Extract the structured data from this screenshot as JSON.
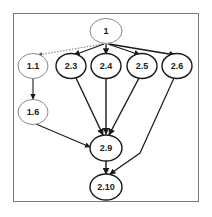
{
  "diagram": {
    "type": "directed-graph",
    "nodes": [
      {
        "id": "1",
        "label": "1",
        "cx": 106,
        "cy": 31,
        "style": "dashed"
      },
      {
        "id": "1.1",
        "label": "1.1",
        "cx": 33,
        "cy": 66,
        "style": "dashed"
      },
      {
        "id": "2.3",
        "label": "2.3",
        "cx": 71,
        "cy": 66,
        "style": "solid"
      },
      {
        "id": "2.4",
        "label": "2.4",
        "cx": 106,
        "cy": 66,
        "style": "solid"
      },
      {
        "id": "2.5",
        "label": "2.5",
        "cx": 142,
        "cy": 66,
        "style": "solid"
      },
      {
        "id": "2.6",
        "label": "2.6",
        "cx": 177,
        "cy": 66,
        "style": "solid"
      },
      {
        "id": "1.6",
        "label": "1.6",
        "cx": 33,
        "cy": 112,
        "style": "dashed"
      },
      {
        "id": "2.9",
        "label": "2.9",
        "cx": 106,
        "cy": 148,
        "style": "solid"
      },
      {
        "id": "2.10",
        "label": "2.10",
        "cx": 106,
        "cy": 187,
        "style": "solid"
      }
    ],
    "edges": [
      {
        "from": "1",
        "to": "1.1",
        "style": "dotted"
      },
      {
        "from": "1",
        "to": "2.3",
        "style": "solid"
      },
      {
        "from": "1",
        "to": "2.4",
        "style": "solid"
      },
      {
        "from": "1",
        "to": "2.5",
        "style": "solid"
      },
      {
        "from": "1",
        "to": "2.6",
        "style": "solid"
      },
      {
        "from": "1.1",
        "to": "1.6",
        "style": "solid"
      },
      {
        "from": "1.6",
        "to": "2.9",
        "style": "solid"
      },
      {
        "from": "2.3",
        "to": "2.9",
        "style": "solid"
      },
      {
        "from": "2.4",
        "to": "2.9",
        "style": "solid"
      },
      {
        "from": "2.5",
        "to": "2.9",
        "style": "solid"
      },
      {
        "from": "2.9",
        "to": "2.10",
        "style": "solid"
      },
      {
        "from": "2.6",
        "to": "2.10",
        "style": "solid"
      }
    ]
  },
  "labels": {
    "n1": "1",
    "n1_1": "1.1",
    "n2_3": "2.3",
    "n2_4": "2.4",
    "n2_5": "2.5",
    "n2_6": "2.6",
    "n1_6": "1.6",
    "n2_9": "2.9",
    "n2_10": "2.10"
  },
  "colors": {
    "solid_stroke": "#1a1a1a",
    "dashed_stroke": "#8a8a8a",
    "frame": "#7a7a7a"
  }
}
